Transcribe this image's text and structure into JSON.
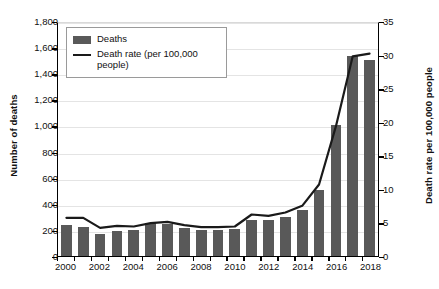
{
  "chart_data": {
    "type": "bar",
    "title": "",
    "subtitle": "",
    "xlabel": "",
    "ylabel": "Number of deaths",
    "y2label": "Death rate per 100,000 people",
    "grid": true,
    "legend_position": "top-left",
    "categories": [
      2000,
      2001,
      2002,
      2003,
      2004,
      2005,
      2006,
      2007,
      2008,
      2009,
      2010,
      2011,
      2012,
      2013,
      2014,
      2015,
      2016,
      2017,
      2018
    ],
    "xtick_labels": [
      "2000",
      "2002",
      "2004",
      "2006",
      "2008",
      "2010",
      "2012",
      "2014",
      "2016",
      "2018"
    ],
    "ylim": [
      0,
      1800
    ],
    "yticks": [
      0,
      200,
      400,
      600,
      800,
      1000,
      1200,
      1400,
      1600,
      1800
    ],
    "ytick_labels": [
      "0",
      "200",
      "400",
      "600",
      "800",
      "1,000",
      "1,200",
      "1,400",
      "1,600",
      "1,800"
    ],
    "y2lim": [
      0,
      35
    ],
    "y2ticks": [
      0,
      5,
      10,
      15,
      20,
      25,
      30,
      35
    ],
    "y2tick_labels": [
      "0",
      "5",
      "10",
      "15",
      "20",
      "25",
      "30",
      "35"
    ],
    "series": [
      {
        "name": "Deaths",
        "type": "bar",
        "axis": "left",
        "color": "#595959",
        "values": [
          235,
          225,
          165,
          195,
          200,
          250,
          245,
          215,
          200,
          200,
          205,
          275,
          275,
          300,
          350,
          505,
          1000,
          1530,
          1500
        ]
      },
      {
        "name": "Death rate (per 100,000 people)",
        "type": "line",
        "axis": "right",
        "color": "#1a1a1a",
        "values": [
          5.8,
          5.8,
          4.3,
          4.6,
          4.5,
          5.0,
          5.2,
          4.7,
          4.4,
          4.4,
          4.5,
          6.3,
          6.1,
          6.6,
          7.6,
          10.8,
          19.5,
          30.0,
          30.4
        ]
      }
    ],
    "legend": [
      {
        "label": "Deaths",
        "marker": "bar-swatch"
      },
      {
        "label": "Death rate (per 100,000 people)",
        "marker": "line-swatch"
      }
    ]
  }
}
